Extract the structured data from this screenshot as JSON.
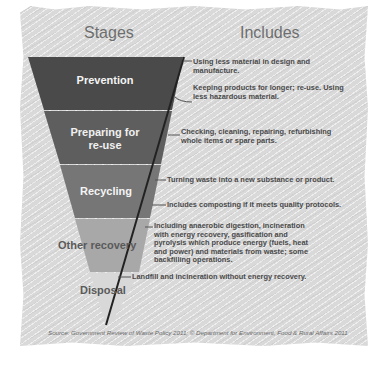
{
  "headers": {
    "stages": "Stages",
    "includes": "Includes"
  },
  "stages": [
    {
      "label": "Prevention",
      "color": "#4a4a4a"
    },
    {
      "label": "Preparing for re-use",
      "line1": "Preparing for",
      "line2": "re-use",
      "color": "#5e5e5e"
    },
    {
      "label": "Recycling",
      "color": "#777777"
    },
    {
      "label": "Other recovery",
      "color": "#a6a6a6"
    },
    {
      "label": "Disposal",
      "color": "#d6d6d6"
    }
  ],
  "includes": [
    {
      "stage": "Prevention",
      "text": "Using less material in design and manufacture."
    },
    {
      "stage": "Prevention",
      "text": "Keeping products for longer; re-use. Using less hazardous material."
    },
    {
      "stage": "Preparing for re-use",
      "text": "Checking, cleaning, repairing, refurbishing whole items or spare parts."
    },
    {
      "stage": "Recycling",
      "text": "Turning waste into a new substance or product."
    },
    {
      "stage": "Recycling",
      "text": "Includes composting if it meets quality protocols."
    },
    {
      "stage": "Other recovery",
      "text": "Including anaerobic digestion, incineration with energy recovery, gasification and pyrolysis which produce energy (fuels, heat and power) and materials from waste; some backfilling operations."
    },
    {
      "stage": "Disposal",
      "text": "Landfill and incineration without energy recovery."
    }
  ],
  "source": "Source: Government Review of Waste Policy 2011; © Department for Environment, Food & Rural Affairs 2011"
}
